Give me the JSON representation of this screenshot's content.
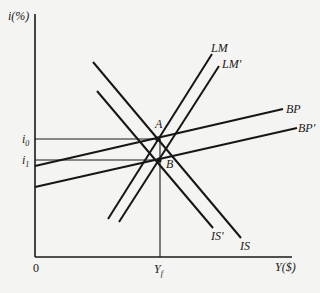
{
  "diagram": {
    "y_axis_label": "i(%)",
    "x_axis_label": "Y($)",
    "origin_label": "0",
    "y_ticks": [
      {
        "label": "i",
        "sub": "0",
        "y": 139
      },
      {
        "label": "i",
        "sub": "1",
        "y": 160
      }
    ],
    "x_ticks": [
      {
        "label": "Y",
        "sub": "f",
        "x": 160
      }
    ],
    "points": [
      {
        "label": "A",
        "x": 158,
        "y": 139
      },
      {
        "label": "B",
        "x": 159,
        "y": 160
      }
    ],
    "curves": [
      {
        "name": "LM",
        "x1": 108,
        "y1": 219,
        "x2": 212,
        "y2": 54
      },
      {
        "name": "LM'",
        "x1": 119,
        "y1": 222,
        "x2": 219,
        "y2": 66
      },
      {
        "name": "IS",
        "x1": 93,
        "y1": 62,
        "x2": 241,
        "y2": 238
      },
      {
        "name": "IS'",
        "x1": 97,
        "y1": 91,
        "x2": 213,
        "y2": 228
      },
      {
        "name": "BP",
        "x1": 35,
        "y1": 166,
        "x2": 283,
        "y2": 109
      },
      {
        "name": "BP'",
        "x1": 35,
        "y1": 187,
        "x2": 297,
        "y2": 128
      }
    ]
  },
  "labels": {
    "y_axis": "i(%)",
    "x_axis": "Y($)",
    "origin": "0",
    "i0_main": "i",
    "i0_sub": "0",
    "i1_main": "i",
    "i1_sub": "1",
    "yf_main": "Y",
    "yf_sub": "f",
    "point_a": "A",
    "point_b": "B",
    "lm": "LM",
    "lm_prime": "LM'",
    "is": "IS",
    "is_prime": "IS'",
    "bp": "BP",
    "bp_prime": "BP'"
  }
}
